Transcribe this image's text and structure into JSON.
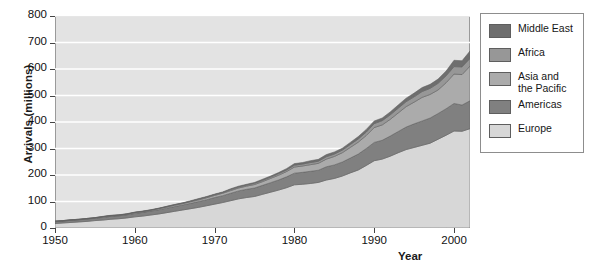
{
  "chart_data": {
    "type": "area",
    "stacked": true,
    "title": "",
    "xlabel": "Year",
    "ylabel": "Arrivals (millions)",
    "xlim": [
      1950,
      2002
    ],
    "ylim": [
      0,
      800
    ],
    "yticks": [
      0,
      100,
      200,
      300,
      400,
      500,
      600,
      700,
      800
    ],
    "xticks": [
      1950,
      1960,
      1970,
      1980,
      1990,
      2000
    ],
    "grid": "horizontal-white",
    "legend_position": "right",
    "x": [
      1950,
      1951,
      1952,
      1953,
      1954,
      1955,
      1956,
      1957,
      1958,
      1959,
      1960,
      1961,
      1962,
      1963,
      1964,
      1965,
      1966,
      1967,
      1968,
      1969,
      1970,
      1971,
      1972,
      1973,
      1974,
      1975,
      1976,
      1977,
      1978,
      1979,
      1980,
      1981,
      1982,
      1983,
      1984,
      1985,
      1986,
      1987,
      1988,
      1989,
      1990,
      1991,
      1992,
      1993,
      1994,
      1995,
      1996,
      1997,
      1998,
      1999,
      2000,
      2001,
      2002
    ],
    "series": [
      {
        "name": "Europe",
        "values": [
          17,
          19,
          21,
          23,
          25,
          28,
          30,
          33,
          35,
          38,
          42,
          45,
          49,
          53,
          58,
          63,
          68,
          73,
          78,
          84,
          90,
          96,
          103,
          110,
          115,
          119,
          127,
          135,
          143,
          152,
          163,
          165,
          168,
          172,
          181,
          187,
          196,
          208,
          219,
          236,
          254,
          260,
          271,
          284,
          296,
          304,
          312,
          320,
          335,
          350,
          366,
          365,
          375
        ]
      },
      {
        "name": "Americas",
        "values": [
          7,
          7,
          8,
          8,
          9,
          9,
          10,
          11,
          11,
          12,
          13,
          14,
          15,
          16,
          17,
          18,
          19,
          20,
          22,
          23,
          25,
          26,
          28,
          30,
          31,
          32,
          34,
          36,
          38,
          41,
          44,
          45,
          46,
          46,
          50,
          51,
          53,
          56,
          60,
          64,
          69,
          71,
          76,
          80,
          85,
          89,
          92,
          95,
          97,
          100,
          104,
          99,
          105
        ]
      },
      {
        "name": "Asia and the Pacific",
        "values": [
          1,
          1,
          1,
          1,
          1,
          1,
          2,
          2,
          2,
          2,
          3,
          3,
          3,
          4,
          4,
          5,
          5,
          6,
          6,
          7,
          8,
          9,
          10,
          11,
          12,
          13,
          14,
          16,
          18,
          20,
          23,
          24,
          25,
          26,
          29,
          32,
          35,
          40,
          45,
          49,
          56,
          58,
          63,
          70,
          77,
          82,
          89,
          89,
          89,
          98,
          111,
          115,
          131
        ]
      },
      {
        "name": "Africa",
        "values": [
          1,
          1,
          1,
          1,
          1,
          1,
          1,
          1,
          1,
          1,
          1,
          1,
          1,
          1,
          2,
          2,
          2,
          2,
          3,
          3,
          3,
          3,
          4,
          4,
          4,
          5,
          5,
          5,
          6,
          6,
          7,
          7,
          8,
          8,
          9,
          9,
          10,
          11,
          12,
          13,
          15,
          16,
          17,
          18,
          19,
          20,
          22,
          23,
          25,
          26,
          28,
          29,
          29
        ]
      },
      {
        "name": "Middle East",
        "values": [
          0,
          0,
          0,
          0,
          0,
          0,
          1,
          1,
          1,
          1,
          1,
          1,
          1,
          1,
          1,
          1,
          1,
          2,
          2,
          2,
          2,
          2,
          3,
          3,
          3,
          3,
          4,
          4,
          4,
          5,
          6,
          6,
          7,
          7,
          8,
          8,
          7,
          8,
          9,
          10,
          10,
          10,
          11,
          12,
          13,
          14,
          15,
          15,
          16,
          18,
          24,
          23,
          28
        ]
      }
    ],
    "colors": {
      "Europe": "#d7d7d7",
      "Americas": "#808080",
      "Asia and the Pacific": "#ababab",
      "Africa": "#979797",
      "Middle East": "#6e6e6e",
      "plot_background": "#e3e3e3",
      "gridline": "#ffffff",
      "axis": "#444444",
      "page_background": "#ffffff"
    }
  },
  "axes": {
    "y_title": "Arrivals (millions)",
    "x_title": "Year",
    "y_tick_labels": [
      "0",
      "100",
      "200",
      "300",
      "400",
      "500",
      "600",
      "700",
      "800"
    ],
    "x_tick_labels": [
      "1950",
      "1960",
      "1970",
      "1980",
      "1990",
      "2000"
    ]
  },
  "legend": {
    "items": [
      {
        "label": "Middle East",
        "color": "#6e6e6e"
      },
      {
        "label": "Africa",
        "color": "#979797"
      },
      {
        "label": "Asia and\nthe Pacific",
        "color": "#ababab"
      },
      {
        "label": "Americas",
        "color": "#808080"
      },
      {
        "label": "Europe",
        "color": "#d7d7d7"
      }
    ]
  }
}
